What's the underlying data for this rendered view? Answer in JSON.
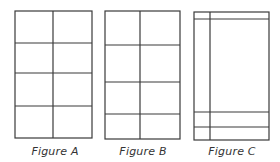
{
  "figures": [
    {
      "label": "Figure A",
      "rect": {
        "x": 15,
        "y": 11,
        "w": 77,
        "h": 127
      },
      "vlines": [
        53
      ],
      "vline_span": [
        11,
        138
      ],
      "hlines": [
        43,
        73,
        106
      ],
      "label_x": 15
    },
    {
      "label": "Figure B",
      "rect": {
        "x": 105,
        "y": 11,
        "w": 75,
        "h": 128
      },
      "vlines": [
        140
      ],
      "vline_span": [
        11,
        139
      ],
      "hlines": [
        45,
        82,
        114
      ],
      "label_x": 103
    },
    {
      "label": "Figure C",
      "rect": {
        "x": 194,
        "y": 12,
        "w": 75,
        "h": 128
      },
      "vlines": [
        210
      ],
      "vline_span": [
        12,
        140
      ],
      "hlines": [
        19,
        112,
        127
      ],
      "label_x": 192
    }
  ],
  "style": {
    "stroke": "#3a3a3a",
    "stroke_width": 1.2,
    "background": "#ffffff"
  }
}
